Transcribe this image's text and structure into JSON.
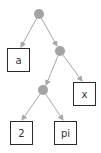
{
  "diagram": {
    "type": "expression-tree",
    "colors": {
      "internal_node": "#a3a3a3",
      "edge": "#a8a8a8",
      "leaf_border": "#2a2a2a",
      "leaf_text": "#333333"
    },
    "nodes": [
      {
        "id": "root",
        "kind": "internal",
        "label": ""
      },
      {
        "id": "n1",
        "kind": "internal",
        "label": ""
      },
      {
        "id": "n2",
        "kind": "internal",
        "label": ""
      },
      {
        "id": "leaf_a",
        "kind": "leaf",
        "label": "a"
      },
      {
        "id": "leaf_x",
        "kind": "leaf",
        "label": "x"
      },
      {
        "id": "leaf_2",
        "kind": "leaf",
        "label": "2"
      },
      {
        "id": "leaf_pi",
        "kind": "leaf",
        "label": "pi"
      }
    ],
    "edges": [
      {
        "from": "root",
        "to": "leaf_a"
      },
      {
        "from": "root",
        "to": "n1"
      },
      {
        "from": "n1",
        "to": "n2"
      },
      {
        "from": "n1",
        "to": "leaf_x"
      },
      {
        "from": "n2",
        "to": "leaf_2"
      },
      {
        "from": "n2",
        "to": "leaf_pi"
      }
    ],
    "leaves": {
      "a": "a",
      "x": "x",
      "two": "2",
      "pi": "pi"
    }
  }
}
